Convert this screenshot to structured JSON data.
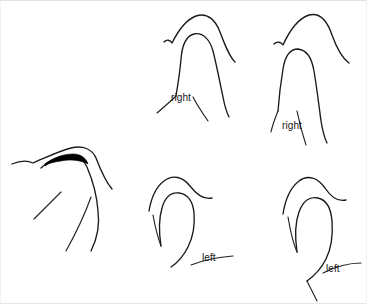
{
  "figure": {
    "name": "vocal-fold-configuration-line-drawings",
    "background_color": "#ffffff",
    "stroke_color": "#1a1a1a",
    "fill_color": "#000000",
    "width": 367,
    "height": 304,
    "panel_count": 5,
    "labels": [
      {
        "id": "top-left-right",
        "text": "right",
        "x": 170,
        "y": 92
      },
      {
        "id": "top-right-right",
        "text": "right",
        "x": 281,
        "y": 120
      },
      {
        "id": "bottom-middle-left",
        "text": "left",
        "x": 201,
        "y": 252
      },
      {
        "id": "bottom-right-left",
        "text": "left",
        "x": 325,
        "y": 263
      }
    ],
    "panels": [
      {
        "id": "panel-top-left",
        "side_label": "right",
        "has_filled_wedge": false,
        "outer_curve": "M 163 41 C 166 38 169 39 171 42 C 176 32 184 19 195 15 C 207 11 215 20 219 31 C 224 44 228 55 234 61",
        "inner_curve": "M 175 95 C 177 83 179 70 180 58 C 181 45 185 35 193 33 C 202 31 209 39 212 50 C 216 66 219 82 222 96 C 224 107 226 112 228 116",
        "left_tail": "M 156 112 C 163 106 170 100 175 95",
        "right_tail": "M 207 120 C 200 110 195 102 192 96"
      },
      {
        "id": "panel-top-right",
        "side_label": "right",
        "has_filled_wedge": false,
        "outer_curve": "M 273 43 C 276 40 280 41 282 44 C 287 33 296 18 308 14 C 320 11 327 22 331 34 C 336 48 341 57 348 62",
        "inner_curve": "M 277 110 C 278 96 280 80 282 68 C 284 55 289 48 297 48 C 306 49 311 58 313 70 C 316 88 318 105 320 120 C 322 132 324 138 326 142",
        "left_tail": "M 270 131 C 272 122 275 115 277 110",
        "right_tail": "M 305 144 C 301 132 298 120 296 110"
      },
      {
        "id": "panel-middle-left",
        "side_label": null,
        "has_filled_wedge": true,
        "outer_curve": "M 11 163 C 18 160 26 159 32 162 C 44 157 58 150 70 147 C 82 144 91 148 95 157 C 100 170 104 180 111 188",
        "inner_curve": "M 40 167 C 46 161 54 157 63 155 C 74 153 82 157 86 166 C 92 180 96 196 97 210 C 99 225 96 238 90 250",
        "wedge": "M 44 163 C 52 157 62 153 72 153 C 80 153 85 157 87 163 C 79 159 69 158 60 160 C 53 161 48 162 44 165 Z",
        "left_tail": "M 33 218 C 42 209 52 199 60 191",
        "right_tail": "M 65 250 C 75 232 84 213 90 196"
      },
      {
        "id": "panel-bottom-middle",
        "side_label": "left",
        "has_filled_wedge": false,
        "outer_curve": "M 148 210 C 150 198 155 186 163 180 C 172 173 182 176 189 185 C 196 194 203 199 211 197",
        "inner_curve": "M 160 245 C 158 232 158 217 161 207 C 164 196 170 191 178 192 C 187 193 192 201 193 212 C 194 224 192 236 187 246 C 182 256 176 262 170 266",
        "left_tail": "M 152 214 C 154 225 157 237 160 245",
        "right_tail": "M 232 255 C 218 256 203 259 190 264"
      },
      {
        "id": "panel-bottom-right",
        "side_label": "left",
        "has_filled_wedge": false,
        "outer_curve": "M 282 213 C 284 200 289 187 298 180 C 307 173 317 177 324 187 C 330 196 337 201 345 199",
        "inner_curve": "M 296 251 C 294 237 294 222 298 211 C 302 200 309 195 317 197 C 326 199 330 208 331 220 C 332 234 330 248 325 258 C 320 268 313 275 306 280",
        "left_tail": "M 287 216 C 289 228 292 242 296 251",
        "right_tail": "M 360 262 C 348 262 334 266 322 272",
        "extra_tail": "M 316 300 C 312 292 309 286 306 280"
      }
    ]
  }
}
